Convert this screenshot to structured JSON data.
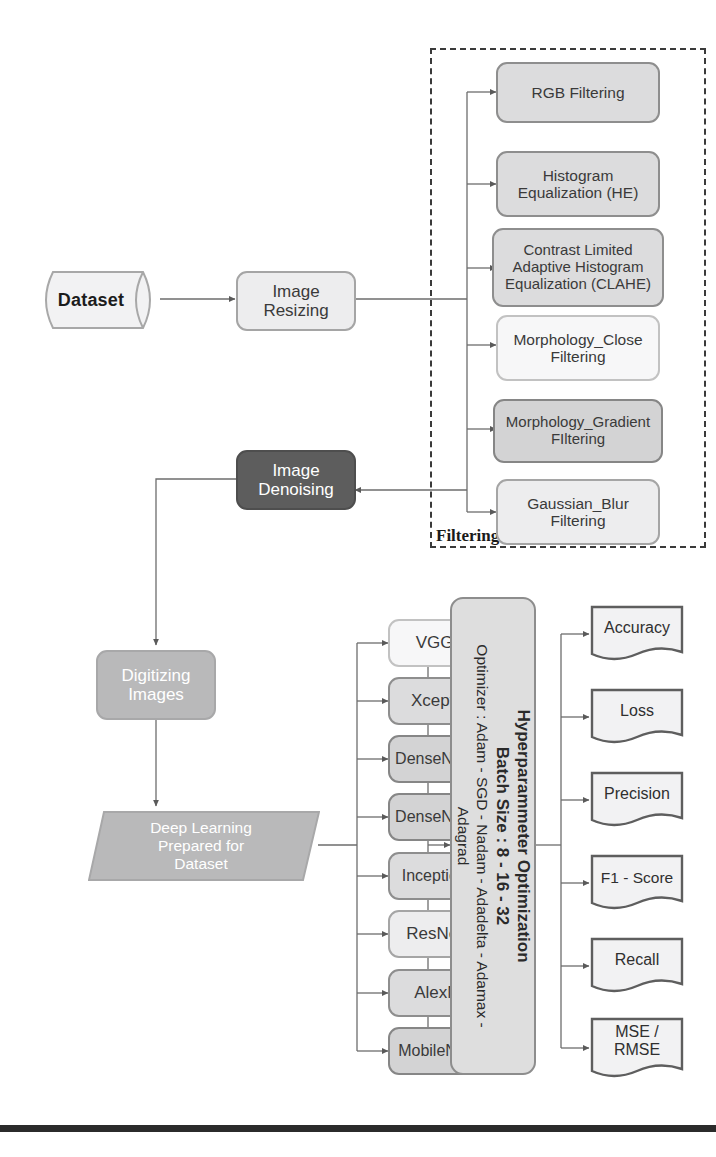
{
  "diagram": {
    "colors": {
      "box_light": "#ededee",
      "box_mid": "#dcdcdd",
      "box_dark": "#5d5d5d",
      "box_gray": "#b9b9ba",
      "border": "#9a9a9a",
      "text": "#3a3a3a",
      "footer": "#2b2b2b"
    },
    "nodes": {
      "dataset": {
        "label": "Dataset",
        "shape": "cylinder"
      },
      "image_resizing": {
        "label": "Image\nResizing",
        "line1": "Image",
        "line2": "Resizing",
        "shape": "rounded-rect"
      },
      "image_denoising": {
        "line1": "Image",
        "line2": "Denoising",
        "shape": "rounded-rect-dark"
      },
      "digitizing_images": {
        "line1": "Digitizing",
        "line2": "Images",
        "shape": "rounded-rect-gray"
      },
      "deep_learning_dataset": {
        "line1": "Deep Learning",
        "line2": "Prepared for",
        "line3": "Dataset",
        "shape": "parallelogram"
      }
    },
    "filtering_group": {
      "label": "Filtering",
      "items": [
        {
          "line1": "RGB Filtering",
          "line2": "",
          "line3": "",
          "shade": "shade-b"
        },
        {
          "line1": "Histogram",
          "line2": "Equalization (HE)",
          "line3": "",
          "shade": "shade-b"
        },
        {
          "line1": "Contrast Limited",
          "line2": "Adaptive Histogram",
          "line3": "Equalization (CLAHE)",
          "shade": "shade-b"
        },
        {
          "line1": "Morphology_Close",
          "line2": "Filtering",
          "line3": "",
          "shade": "shade-white"
        },
        {
          "line1": "Morphology_Gradient",
          "line2": "FIltering",
          "line3": "",
          "shade": "shade-c"
        },
        {
          "line1": "Gaussian_Blur",
          "line2": "Filtering",
          "line3": "",
          "shade": "shade-a"
        }
      ]
    },
    "models": [
      {
        "label": "VGG16",
        "shade": "shade-white"
      },
      {
        "label": "Xception",
        "shade": "shade-b"
      },
      {
        "label": "DenseNet121",
        "shade": "shade-c"
      },
      {
        "label": "DenseNet169",
        "shade": "shade-c"
      },
      {
        "label": "InceptionV3",
        "shade": "shade-b"
      },
      {
        "label": "ResNet50",
        "shade": "shade-a"
      },
      {
        "label": "AlexNet",
        "shade": "shade-b"
      },
      {
        "label": "MobileNetV2",
        "shade": "shade-c"
      }
    ],
    "hyperparameter": {
      "line1": "Hyperparammeter Optimization",
      "line2": "Batch Size : 8 - 16 - 32",
      "line3": "Optimizer : Adam - SGD - Nadam - Adadelta - Adamax -",
      "line4": "Adagrad"
    },
    "metrics": [
      {
        "line1": "Accuracy",
        "line2": ""
      },
      {
        "line1": "Loss",
        "line2": ""
      },
      {
        "line1": "Precision",
        "line2": ""
      },
      {
        "line1": "F1 - Score",
        "line2": ""
      },
      {
        "line1": "Recall",
        "line2": ""
      },
      {
        "line1": "MSE /",
        "line2": "RMSE"
      }
    ]
  }
}
